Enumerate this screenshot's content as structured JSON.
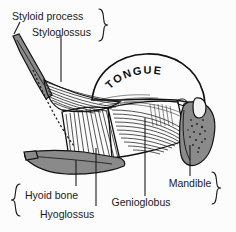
{
  "figure": {
    "title_text": "TONGUE",
    "background_color": "#fcfcfc",
    "ink_color": "#111111",
    "bone_color": "#8a8a8a",
    "labels": {
      "styloid_process": "Styloid process",
      "styloglossus": "Styloglossus",
      "hyoid_bone": "Hyoid bone",
      "hyoglossus": "Hyoglossus",
      "genioglobus": "Genioglobus",
      "mandible": "Mandible"
    },
    "structures": [
      {
        "name": "styloid-process",
        "kind": "bone",
        "color": "#8a8a8a"
      },
      {
        "name": "hyoid-bone",
        "kind": "bone",
        "color": "#8a8a8a"
      },
      {
        "name": "mandible",
        "kind": "bone",
        "color": "#8a8a8a"
      },
      {
        "name": "tongue",
        "kind": "soft-tissue",
        "color": "#ffffff"
      },
      {
        "name": "styloglossus-muscle",
        "kind": "muscle",
        "color": "#ffffff"
      },
      {
        "name": "hyoglossus-muscle",
        "kind": "muscle",
        "color": "#ffffff"
      },
      {
        "name": "genioglossus-muscle",
        "kind": "muscle",
        "color": "#ffffff"
      }
    ],
    "braces": [
      {
        "name": "top-right-brace",
        "direction": "right",
        "groups": [
          "Styloid process",
          "Styloglossus"
        ]
      },
      {
        "name": "bottom-left-brace",
        "direction": "left",
        "groups": [
          "Hyoid bone",
          "Hyoglossus"
        ]
      },
      {
        "name": "bottom-right-brace",
        "direction": "right",
        "groups": [
          "Mandible",
          "Genioglobus"
        ]
      }
    ]
  }
}
